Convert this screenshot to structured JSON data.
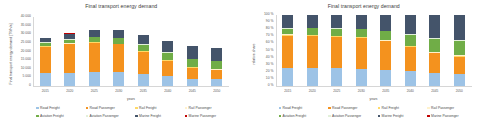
{
  "colors": {
    "road_freight": "#9DC3E6",
    "road_passenger": "#F4921E",
    "rail_freight": "#FFD966",
    "rail_passenger": "#FFF2CC",
    "aviation_freight": "#70AD47",
    "aviation_passenger": "#E2F0D9",
    "marine_freight": "#44546A",
    "marine_passenger": "#C00000",
    "axis": "#d6d6d6",
    "text": "#4a4a4a"
  },
  "legend": {
    "items": [
      {
        "label": "Road Freight",
        "color_key": "road_freight",
        "icon": "legend-square-icon"
      },
      {
        "label": "Road Passenger",
        "color_key": "road_passenger",
        "icon": "legend-square-icon"
      },
      {
        "label": "Rail Freight",
        "color_key": "rail_freight",
        "icon": "legend-square-icon"
      },
      {
        "label": "Rail Passenger",
        "color_key": "rail_passenger",
        "icon": "legend-square-icon"
      },
      {
        "label": "Aviation Freight",
        "color_key": "aviation_freight",
        "icon": "legend-square-icon"
      },
      {
        "label": "Aviation Passenger",
        "color_key": "aviation_passenger",
        "icon": "legend-square-icon"
      },
      {
        "label": "Marine Freight",
        "color_key": "marine_freight",
        "icon": "legend-square-icon"
      },
      {
        "label": "Marine Passenger",
        "color_key": "marine_passenger",
        "icon": "legend-square-icon"
      }
    ]
  },
  "chart_data": [
    {
      "id": "absolute",
      "type": "bar",
      "stacked": true,
      "title": "Final transport energy demand",
      "xlabel": "years",
      "ylabel": "Final transport energy demand [TWh/a]",
      "ylim": [
        0,
        40000
      ],
      "yticks": [
        0,
        5000,
        10000,
        15000,
        20000,
        25000,
        30000,
        35000,
        40000
      ],
      "ytick_labels": [
        "0",
        "5 000",
        "10 000",
        "15 000",
        "20 000",
        "25 000",
        "30 000",
        "35 000",
        "40 000"
      ],
      "grid": false,
      "legend_position": "bottom",
      "categories": [
        "2015",
        "2020",
        "2025",
        "2030",
        "2035",
        "2040",
        "2045",
        "2050"
      ],
      "series": [
        {
          "name": "Road Freight",
          "color_key": "road_freight",
          "values": [
            7300,
            7800,
            8100,
            8000,
            7100,
            5600,
            4300,
            3900
          ]
        },
        {
          "name": "Road Passenger",
          "color_key": "road_passenger",
          "values": [
            15600,
            16400,
            17000,
            16100,
            12900,
            9100,
            6400,
            5400
          ]
        },
        {
          "name": "Rail Freight",
          "color_key": "rail_freight",
          "values": [
            250,
            260,
            270,
            270,
            260,
            250,
            240,
            235
          ]
        },
        {
          "name": "Rail Passenger",
          "color_key": "rail_passenger",
          "values": [
            210,
            220,
            230,
            235,
            235,
            230,
            225,
            220
          ]
        },
        {
          "name": "Aviation Freight",
          "color_key": "aviation_freight",
          "values": [
            1800,
            2300,
            2700,
            3100,
            3600,
            4100,
            4500,
            4700
          ]
        },
        {
          "name": "Aviation Passenger",
          "color_key": "aviation_passenger",
          "values": [
            140,
            150,
            160,
            170,
            180,
            190,
            195,
            200
          ]
        },
        {
          "name": "Marine Freight",
          "color_key": "marine_freight",
          "values": [
            2600,
            3300,
            4000,
            4600,
            5500,
            6600,
            7300,
            7600
          ]
        },
        {
          "name": "Marine Passenger",
          "color_key": "marine_passenger",
          "values": [
            60,
            65,
            70,
            72,
            75,
            78,
            80,
            82
          ]
        }
      ]
    },
    {
      "id": "relative",
      "type": "bar",
      "stacked": true,
      "normalized": true,
      "title": "Final transport energy demand",
      "xlabel": "years",
      "ylabel": "relative share",
      "ylim": [
        0,
        100
      ],
      "yticks": [
        0,
        10,
        20,
        30,
        40,
        50,
        60,
        70,
        80,
        90,
        100
      ],
      "ytick_labels": [
        "0 %",
        "10 %",
        "20 %",
        "30 %",
        "40 %",
        "50 %",
        "60 %",
        "70 %",
        "80 %",
        "90 %",
        "100 %"
      ],
      "grid": false,
      "legend_position": "bottom",
      "categories": [
        "2015",
        "2020",
        "2025",
        "2030",
        "2035",
        "2040",
        "2045",
        "2050"
      ],
      "series": [
        {
          "name": "Road Freight",
          "color_key": "road_freight",
          "values": [
            25.4,
            25.2,
            24.8,
            24.5,
            23.2,
            21.0,
            18.4,
            17.2
          ]
        },
        {
          "name": "Road Passenger",
          "color_key": "road_passenger",
          "values": [
            45.6,
            45.0,
            44.3,
            43.0,
            40.0,
            34.0,
            27.4,
            24.0
          ]
        },
        {
          "name": "Rail Freight",
          "color_key": "rail_freight",
          "values": [
            1.1,
            1.0,
            0.9,
            0.9,
            0.9,
            0.9,
            1.0,
            1.0
          ]
        },
        {
          "name": "Rail Passenger",
          "color_key": "rail_passenger",
          "values": [
            0.9,
            0.8,
            0.8,
            0.8,
            0.8,
            0.9,
            1.0,
            1.0
          ]
        },
        {
          "name": "Aviation Freight",
          "color_key": "aviation_freight",
          "values": [
            8.0,
            9.1,
            9.8,
            10.5,
            12.4,
            15.2,
            19.0,
            20.6
          ]
        },
        {
          "name": "Aviation Passenger",
          "color_key": "aviation_passenger",
          "values": [
            0.6,
            0.6,
            0.6,
            0.6,
            0.7,
            0.8,
            0.9,
            0.9
          ]
        },
        {
          "name": "Marine Freight",
          "color_key": "marine_freight",
          "values": [
            18.1,
            18.1,
            18.6,
            19.5,
            21.8,
            27.0,
            31.9,
            35.0
          ]
        },
        {
          "name": "Marine Passenger",
          "color_key": "marine_passenger",
          "values": [
            0.3,
            0.2,
            0.2,
            0.2,
            0.2,
            0.2,
            0.4,
            0.3
          ]
        }
      ]
    }
  ]
}
